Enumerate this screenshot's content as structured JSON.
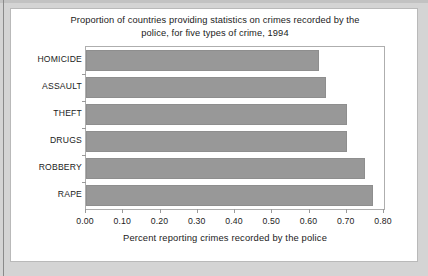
{
  "chart_data": {
    "type": "bar",
    "orientation": "horizontal",
    "title": "Proportion of countries providing statistics on crimes recorded by the police, for five types of crime, 1994",
    "title_line1": "Proportion of countries providing statistics on crimes recorded by the",
    "title_line2": "police, for five types of crime, 1994",
    "categories": [
      "HOMICIDE",
      "ASSAULT",
      "THEFT",
      "DRUGS",
      "ROBBERY",
      "RAPE"
    ],
    "values": [
      0.625,
      0.645,
      0.7,
      0.7,
      0.75,
      0.77
    ],
    "xlabel": "Percent reporting crimes recorded by the police",
    "ylabel": "",
    "xlim": [
      0.0,
      0.8
    ],
    "xticks": [
      "0.00",
      "0.10",
      "0.20",
      "0.30",
      "0.40",
      "0.50",
      "0.60",
      "0.70",
      "0.80"
    ],
    "xtick_values": [
      0.0,
      0.1,
      0.2,
      0.3,
      0.4,
      0.5,
      0.6,
      0.7,
      0.8
    ],
    "grid": false,
    "legend": false,
    "bar_color": "#989898",
    "bar_edge_color": "#8e8e8e",
    "plot_background": "#ffffff",
    "frame_color": "#aeaeae",
    "text_color": "#1b1b1b",
    "card_background": "#ffffff",
    "page_background": "#d4d4d4"
  }
}
